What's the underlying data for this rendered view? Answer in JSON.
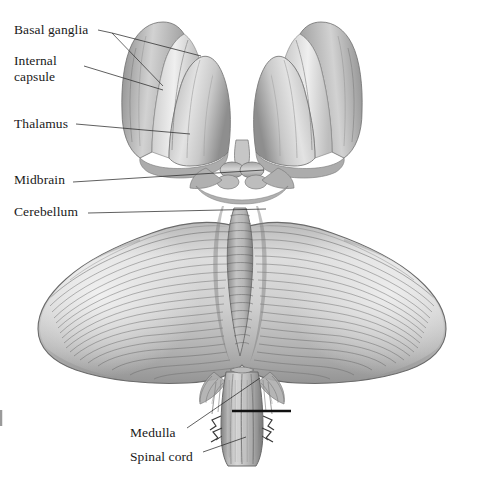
{
  "figure": {
    "kind": "anatomical-illustration",
    "style": "grayscale pencil / graphite shading on white background",
    "background_color": "#ffffff",
    "ink_color": "#1a1a1a",
    "tone_light": "#e8e8e8",
    "tone_mid": "#b4b4b4",
    "tone_dark": "#7a7a7a",
    "tone_deep": "#4f4f4f"
  },
  "labels": [
    {
      "id": "basal-ganglia",
      "text": "Basal ganglia",
      "x": 14,
      "y": 22,
      "leader": "forked"
    },
    {
      "id": "internal-capsule",
      "text": "Internal\ncapsule",
      "x": 14,
      "y": 53,
      "leader": "straight"
    },
    {
      "id": "thalamus",
      "text": "Thalamus",
      "x": 14,
      "y": 116,
      "leader": "straight"
    },
    {
      "id": "midbrain",
      "text": "Midbrain",
      "x": 14,
      "y": 172,
      "leader": "straight"
    },
    {
      "id": "cerebellum",
      "text": "Cerebellum",
      "x": 14,
      "y": 204,
      "leader": "straight"
    },
    {
      "id": "medulla",
      "text": "Medulla",
      "x": 130,
      "y": 425,
      "leader": "straight"
    },
    {
      "id": "spinal-cord",
      "text": "Spinal cord",
      "x": 130,
      "y": 449,
      "leader": "straight"
    }
  ],
  "structures": [
    {
      "id": "basal-ganglia",
      "name": "Basal ganglia",
      "note": "outer banded rim of each cerebral mass"
    },
    {
      "id": "internal-capsule",
      "name": "Internal capsule",
      "note": "pale band between basal ganglia and thalamus"
    },
    {
      "id": "thalamus",
      "name": "Thalamus",
      "note": "large ovoid body of each hemisphere"
    },
    {
      "id": "midbrain",
      "name": "Midbrain",
      "note": "central stem between thalami and cerebellum"
    },
    {
      "id": "cerebellum",
      "name": "Cerebellum",
      "note": "wide butterfly mass with horizontal folia and central vermis"
    },
    {
      "id": "medulla",
      "name": "Medulla",
      "note": "brainstem segment below cerebellum"
    },
    {
      "id": "spinal-cord",
      "name": "Spinal cord",
      "note": "continuation below the transverse marker line"
    }
  ],
  "markers": [
    {
      "id": "medulla-spinal-boundary",
      "type": "transverse-rule",
      "x1": 232,
      "x2": 291,
      "y": 411,
      "color": "#111111"
    },
    {
      "id": "left-edge-tick",
      "type": "tick",
      "x": 2,
      "y": 418,
      "color": "#9a9a9a"
    }
  ]
}
